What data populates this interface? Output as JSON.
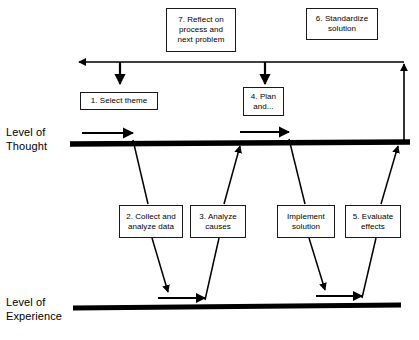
{
  "diagram": {
    "axes": [
      {
        "id": "thought",
        "label": "Level of\nThought"
      },
      {
        "id": "experience",
        "label": "Level of\nExperience"
      }
    ],
    "steps": [
      {
        "id": "step-7",
        "label": "7. Reflect on\nprocess and\nnext problem",
        "level": "thought"
      },
      {
        "id": "step-6",
        "label": "6. Standardize\nsolution",
        "level": "thought"
      },
      {
        "id": "step-1",
        "label": "1. Select theme",
        "level": "thought"
      },
      {
        "id": "step-4",
        "label": "4. Plan\nand...",
        "level": "thought"
      },
      {
        "id": "step-2",
        "label": "2. Collect and\nanalyze data",
        "level": "experience"
      },
      {
        "id": "step-3",
        "label": "3. Analyze\ncauses",
        "level": "experience"
      },
      {
        "id": "step-implement",
        "label": "Implement\nsolution",
        "level": "experience"
      },
      {
        "id": "step-5",
        "label": "5. Evaluate\neffects",
        "level": "experience"
      }
    ],
    "colors": {
      "ink": "#000000",
      "box_border": "#1a1a1a",
      "background": "#ffffff"
    }
  }
}
